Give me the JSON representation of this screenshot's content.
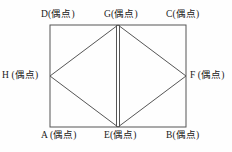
{
  "figure": {
    "name": "rectangle-with-inscribed-rhombus",
    "stroke_color": "#555555",
    "background_color": "#fefefe",
    "label_color": "#1a1a1a"
  },
  "geometry": {
    "rect": {
      "left": 50,
      "top": 25,
      "right": 186,
      "bottom": 127
    },
    "points": {
      "A": {
        "x": 50,
        "y": 127,
        "role": "rectangle-corner-bottom-left"
      },
      "B": {
        "x": 186,
        "y": 127,
        "role": "rectangle-corner-bottom-right"
      },
      "C": {
        "x": 186,
        "y": 25,
        "role": "rectangle-corner-top-right"
      },
      "D": {
        "x": 50,
        "y": 25,
        "role": "rectangle-corner-top-left"
      },
      "E": {
        "x": 118,
        "y": 127,
        "role": "midpoint-bottom-edge"
      },
      "F": {
        "x": 186,
        "y": 76,
        "role": "midpoint-right-edge"
      },
      "G": {
        "x": 118,
        "y": 25,
        "role": "midpoint-top-edge"
      },
      "H": {
        "x": 50,
        "y": 76,
        "role": "midpoint-left-edge"
      }
    },
    "edges": [
      {
        "from": "D",
        "to": "C",
        "kind": "rectangle-side"
      },
      {
        "from": "C",
        "to": "B",
        "kind": "rectangle-side"
      },
      {
        "from": "B",
        "to": "A",
        "kind": "rectangle-side"
      },
      {
        "from": "A",
        "to": "D",
        "kind": "rectangle-side"
      },
      {
        "from": "H",
        "to": "G",
        "kind": "rhombus-side"
      },
      {
        "from": "G",
        "to": "F",
        "kind": "rhombus-side"
      },
      {
        "from": "F",
        "to": "E",
        "kind": "rhombus-side"
      },
      {
        "from": "E",
        "to": "H",
        "kind": "rhombus-side"
      },
      {
        "from": "G",
        "to": "E",
        "kind": "doubled-vertical-segment"
      }
    ]
  },
  "labels": {
    "D": "D(偶点)",
    "G": "G(偶点)",
    "C": "C(偶点)",
    "H": "H (偶点)",
    "F": "F (偶点)",
    "A": "A (偶点)",
    "E": "E(偶点)",
    "B": "B(偶点)"
  }
}
